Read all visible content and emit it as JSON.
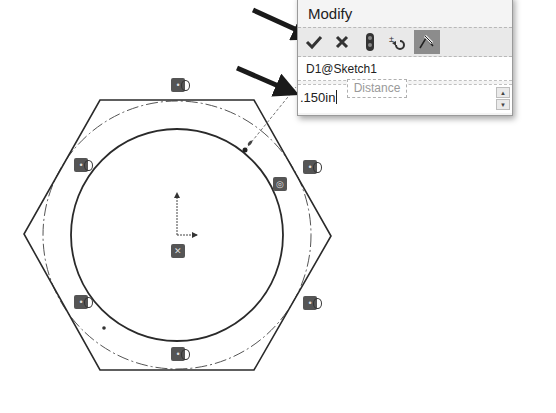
{
  "dialog": {
    "title": "Modify",
    "toolbar": {
      "buttons": [
        {
          "name": "ok",
          "icon": "check-icon",
          "glyph": "✔"
        },
        {
          "name": "cancel",
          "icon": "close-icon",
          "glyph": "✖"
        },
        {
          "name": "rebuild",
          "icon": "traffic-light-icon",
          "glyph": "●"
        },
        {
          "name": "reverse",
          "icon": "reverse-sense-icon",
          "glyph": "±↺"
        },
        {
          "name": "mark-for-drawing",
          "icon": "dimension-mark-icon",
          "glyph": "✎",
          "active": true
        }
      ]
    },
    "dimension_name": "D1@Sketch1",
    "value": ".150in",
    "tooltip": "Distance",
    "spinner": {
      "up": "▲",
      "down": "▼"
    }
  },
  "sketch": {
    "hexagon_vertices": [
      [
        100,
        100
      ],
      [
        254,
        100
      ],
      [
        331,
        236
      ],
      [
        254,
        370
      ],
      [
        100,
        370
      ],
      [
        24,
        234
      ]
    ],
    "inner_circle": {
      "cx": 177,
      "cy": 235,
      "r": 106
    },
    "construction_circle": {
      "cx": 177,
      "cy": 235,
      "r": 134
    },
    "origin": {
      "x": 177,
      "y": 235
    },
    "relations": [
      {
        "x": 171,
        "y": 78,
        "type": "tangent"
      },
      {
        "x": 74,
        "y": 158,
        "type": "tangent"
      },
      {
        "x": 303,
        "y": 160,
        "type": "tangent"
      },
      {
        "x": 273,
        "y": 177,
        "type": "coincident"
      },
      {
        "x": 171,
        "y": 244,
        "type": "fix"
      },
      {
        "x": 74,
        "y": 295,
        "type": "tangent"
      },
      {
        "x": 303,
        "y": 296,
        "type": "tangent"
      },
      {
        "x": 171,
        "y": 347,
        "type": "tangent"
      }
    ],
    "dimension_leader": {
      "x1": 245,
      "y1": 150,
      "x2": 296,
      "y2": 87
    },
    "point": {
      "x": 104,
      "y": 328
    }
  },
  "annotations": {
    "arrows": [
      {
        "x1": 253,
        "y1": 10,
        "x2": 318,
        "y2": 40
      },
      {
        "x1": 237,
        "y1": 68,
        "x2": 300,
        "y2": 96
      }
    ],
    "arrow_color": "#1a1a1a"
  },
  "colors": {
    "sketch_line": "#2a2a2a",
    "construction_line": "#555555",
    "dialog_bg": "#f4f4f4",
    "active_button": "#8c8c8c"
  }
}
